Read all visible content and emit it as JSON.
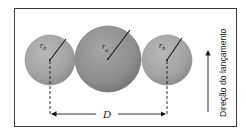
{
  "diagram": {
    "labels": {
      "left_radius": "r",
      "left_radius_sub": "b",
      "middle_radius": "r",
      "middle_radius_sub": "a",
      "right_radius": "r",
      "right_radius_sub": "b",
      "distance": "D",
      "direction": "Direção do lançamento"
    },
    "colors": {
      "sphere_fill": "#a8a8a8",
      "sphere_dark": "#7e7e7e",
      "frame": "#3c3c3c",
      "line": "#1a1a1a"
    }
  }
}
